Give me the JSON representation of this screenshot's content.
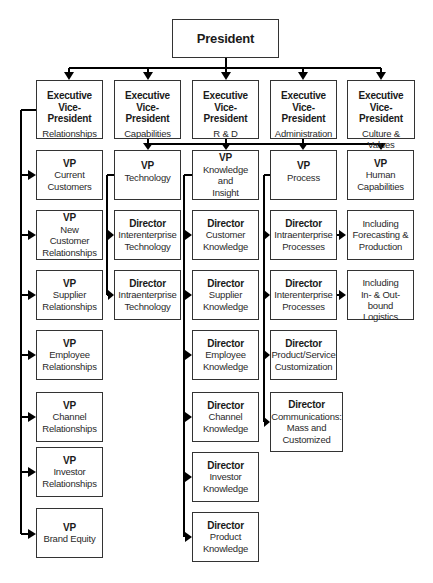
{
  "title_fragment": "",
  "president": {
    "label": "President"
  },
  "evps": [
    {
      "title": "Executive Vice- President",
      "title_line1": "Executive",
      "title_line2": "Vice- President",
      "area": "Relationships"
    },
    {
      "title": "Executive Vice- President",
      "title_line1": "Executive",
      "title_line2": "Vice- President",
      "area": "Capabilities"
    },
    {
      "title": "Executive Vice- President",
      "title_line1": "Executive",
      "title_line2": "Vice- President",
      "area": "R & D"
    },
    {
      "title": "Executive Vice- President",
      "title_line1": "Executive",
      "title_line2": "Vice- President",
      "area": "Administration"
    },
    {
      "title": "Executive Vice- President",
      "title_line1": "Executive",
      "title_line2": "Vice- President",
      "area_line1": "Culture &",
      "area_line2": "Values",
      "area": "Culture & Values"
    }
  ],
  "relationships_vps": [
    {
      "title": "VP",
      "line1": "Current",
      "line2": "Customers"
    },
    {
      "title": "VP",
      "line1": "New Customer",
      "line2": "Relationships"
    },
    {
      "title": "VP",
      "line1": "Supplier",
      "line2": "Relationships"
    },
    {
      "title": "VP",
      "line1": "Employee",
      "line2": "Relationships"
    },
    {
      "title": "VP",
      "line1": "Channel",
      "line2": "Relationships"
    },
    {
      "title": "VP",
      "line1": "Investor",
      "line2": "Relationships"
    },
    {
      "title": "VP",
      "line1": "Brand Equity",
      "line2": ""
    }
  ],
  "technology": {
    "vp": {
      "title": "VP",
      "line1": "Technology"
    },
    "directors": [
      {
        "title": "Director",
        "line1": "Interenterprise",
        "line2": "Technology"
      },
      {
        "title": "Director",
        "line1": "Intraenterprise",
        "line2": "Technology"
      }
    ]
  },
  "knowledge": {
    "vp": {
      "title": "VP",
      "line1": "Knowledge and",
      "line2": "Insight"
    },
    "directors": [
      {
        "title": "Director",
        "line1": "Customer",
        "line2": "Knowledge"
      },
      {
        "title": "Director",
        "line1": "Supplier",
        "line2": "Knowledge"
      },
      {
        "title": "Director",
        "line1": "Employee",
        "line2": "Knowledge"
      },
      {
        "title": "Director",
        "line1": "Channel",
        "line2": "Knowledge"
      },
      {
        "title": "Director",
        "line1": "Investor",
        "line2": "Knowledge"
      },
      {
        "title": "Director",
        "line1": "Product",
        "line2": "Knowledge"
      }
    ]
  },
  "process": {
    "vp": {
      "title": "VP",
      "line1": "Process"
    },
    "directors": [
      {
        "title": "Director",
        "line1": "Intraenterprise",
        "line2": "Processes"
      },
      {
        "title": "Director",
        "line1": "Interenterprise",
        "line2": "Processes"
      },
      {
        "title": "Director",
        "line1": "Product/Service",
        "line2": "Customization"
      },
      {
        "title": "Director",
        "line1": "Communications:",
        "line2": "Mass and",
        "line3": "Customized"
      }
    ]
  },
  "human": {
    "vp": {
      "title": "VP",
      "line1": "Human",
      "line2": "Capabilities"
    },
    "notes": [
      {
        "line1": "Including",
        "line2": "Forecasting &",
        "line3": "Production"
      },
      {
        "line1": "Including",
        "line2": "In- & Out-bound",
        "line3": "Logistics"
      }
    ]
  },
  "colors": {
    "line": "#000000",
    "border": "#333333",
    "background": "#ffffff"
  }
}
